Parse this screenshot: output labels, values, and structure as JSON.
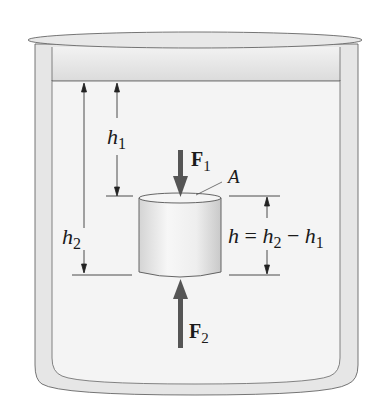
{
  "diagram": {
    "labels": {
      "h1": {
        "base": "h",
        "sub": "1"
      },
      "h2": {
        "base": "h",
        "sub": "2"
      },
      "F1": {
        "base": "F",
        "sub": "1"
      },
      "F2": {
        "base": "F",
        "sub": "2"
      },
      "area": "A",
      "equation": {
        "lhs": "h",
        "eq": " = ",
        "t1": "h",
        "s1": "2",
        "minus": " − ",
        "t2": "h",
        "s2": "1"
      }
    },
    "colors": {
      "container_fill": "#e9e9e9",
      "container_stroke": "#555555",
      "liquid_fill": "#f3f3f3",
      "arrow": "#555555",
      "cylinder_fill": "#ececec"
    }
  }
}
